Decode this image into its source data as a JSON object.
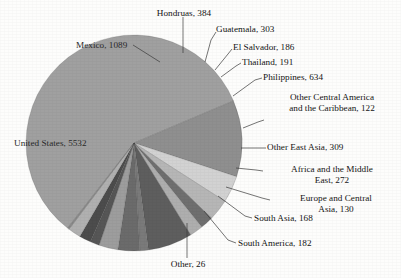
{
  "chart_data": {
    "type": "pie",
    "title": "",
    "subtitle": "",
    "xlabel": "",
    "ylabel": "",
    "legend_position": "none",
    "labels_mode": "callout-with-leader-lines",
    "total": 9528,
    "categories": [
      "United States",
      "Mexico",
      "Hondruas",
      "Guatemala",
      "El Salvador",
      "Thailand",
      "Philippines",
      "Other Central America and the Caribbean",
      "Other East Asia",
      "Africa and the Middle East",
      "Europe and Central Asia",
      "South Asia",
      "South America",
      "Other"
    ],
    "values": [
      5532,
      1089,
      384,
      303,
      186,
      191,
      634,
      122,
      309,
      272,
      130,
      168,
      182,
      26
    ],
    "colors": [
      "#a0a0a0",
      "#8f8f8f",
      "#d2d2d2",
      "#b6b6b6",
      "#6f6f6f",
      "#aeaeae",
      "#5e5e5e",
      "#7a7a7a",
      "#6b6b6b",
      "#9d9d9d",
      "#565656",
      "#4c4c4c",
      "#b0b0b0",
      "#8a8a8a"
    ],
    "slices": [
      {
        "name": "United States",
        "value": 5532,
        "label": "United States, 5532",
        "color": "#a0a0a0"
      },
      {
        "name": "Mexico",
        "value": 1089,
        "label": "Mexico, 1089",
        "color": "#8f8f8f"
      },
      {
        "name": "Hondruas",
        "value": 384,
        "label": "Hondruas, 384",
        "color": "#d2d2d2"
      },
      {
        "name": "Guatemala",
        "value": 303,
        "label": "Guatemala, 303",
        "color": "#b6b6b6"
      },
      {
        "name": "El Salvador",
        "value": 186,
        "label": "El Salvador, 186",
        "color": "#6f6f6f"
      },
      {
        "name": "Thailand",
        "value": 191,
        "label": "Thailand, 191",
        "color": "#aeaeae"
      },
      {
        "name": "Philippines",
        "value": 634,
        "label": "Philippines, 634",
        "color": "#5e5e5e"
      },
      {
        "name": "Other Central America and the Caribbean",
        "value": 122,
        "label_line1": "Other Central America",
        "label_line2": "and the Caribbean, 122",
        "color": "#7a7a7a"
      },
      {
        "name": "Other East Asia",
        "value": 309,
        "label": "Other East Asia, 309",
        "color": "#6b6b6b"
      },
      {
        "name": "Africa and the Middle East",
        "value": 272,
        "label_line1": "Africa and the Middle",
        "label_line2": "East, 272",
        "color": "#9d9d9d"
      },
      {
        "name": "Europe and Central Asia",
        "value": 130,
        "label_line1": "Europe and Central",
        "label_line2": "Asia, 130",
        "color": "#565656"
      },
      {
        "name": "South Asia",
        "value": 168,
        "label": "South Asia, 168",
        "color": "#4c4c4c"
      },
      {
        "name": "South America",
        "value": 182,
        "label": "South America, 182",
        "color": "#b0b0b0"
      },
      {
        "name": "Other",
        "value": 26,
        "label": "Other, 26",
        "color": "#8a8a8a"
      }
    ]
  },
  "labels": {
    "hondruas": "Hondruas, 384",
    "guatemala": "Guatemala, 303",
    "el_salvador": "El Salvador, 186",
    "thailand": "Thailand, 191",
    "philippines": "Philippines, 634",
    "mexico": "Mexico, 1089",
    "united_states": "United States, 5532",
    "other_central_america_l1": "Other Central America",
    "other_central_america_l2": "and the Caribbean, 122",
    "other_east_asia": "Other East Asia, 309",
    "africa_middle_east_l1": "Africa and the Middle",
    "africa_middle_east_l2": "East, 272",
    "europe_central_asia_l1": "Europe and Central",
    "europe_central_asia_l2": "Asia, 130",
    "south_asia": "South Asia, 168",
    "south_america": "South America, 182",
    "other": "Other, 26"
  }
}
